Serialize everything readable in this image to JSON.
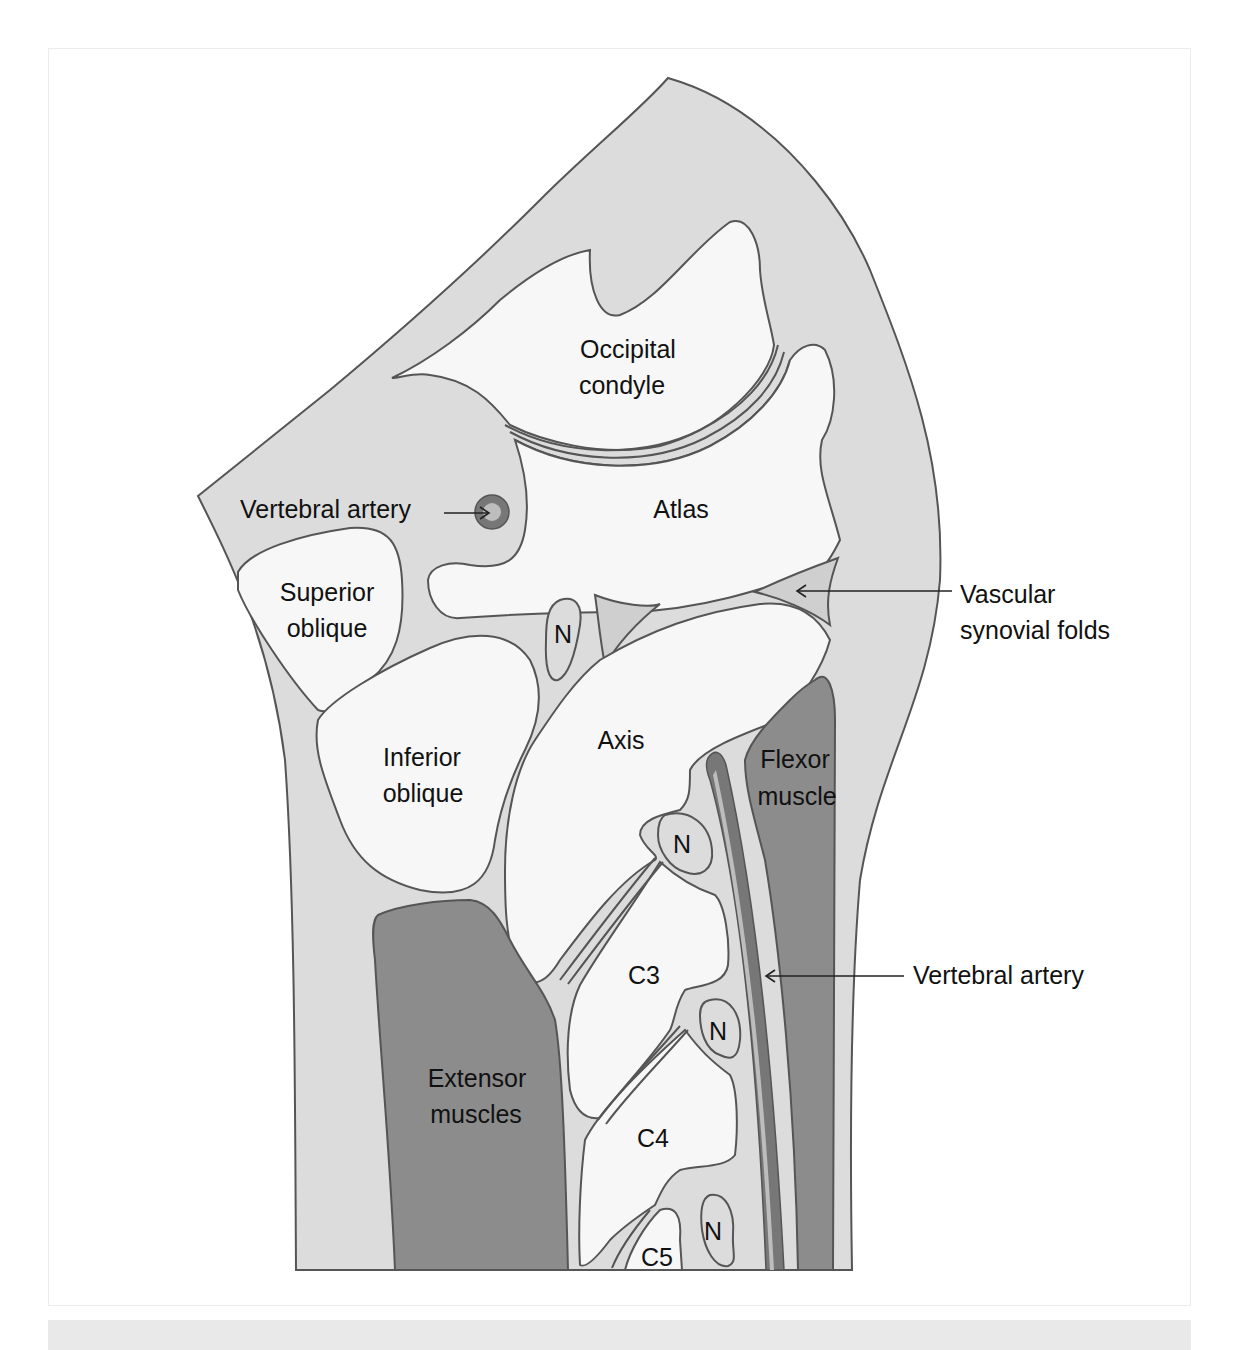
{
  "figure": {
    "colors": {
      "background": "#ffffff",
      "soft_tissue": "#dcdcdc",
      "bone": "#f7f7f7",
      "muscle": "#8c8c8c",
      "synovial_fold": "#cfcfcf",
      "artery_outer": "#777777",
      "artery_inner": "#bdbdbd",
      "outline": "#555555",
      "text": "#111111",
      "footer_band": "#e9e9e9"
    },
    "labels": {
      "occipital_condyle": [
        "Occipital",
        "condyle"
      ],
      "atlas": "Atlas",
      "vertebral_artery_top": "Vertebral artery",
      "superior_oblique": [
        "Superior",
        "oblique"
      ],
      "inferior_oblique": [
        "Inferior",
        "oblique"
      ],
      "axis": "Axis",
      "nerve_1": "N",
      "nerve_2": "N",
      "nerve_3": "N",
      "nerve_4": "N",
      "vascular_synovial_folds": [
        "Vascular",
        "synovial folds"
      ],
      "flexor_muscle": [
        "Flexor",
        "muscle"
      ],
      "extensor_muscles": [
        "Extensor",
        "muscles"
      ],
      "c3": "C3",
      "c4": "C4",
      "c5": "C5",
      "vertebral_artery_right": "Vertebral artery"
    }
  }
}
